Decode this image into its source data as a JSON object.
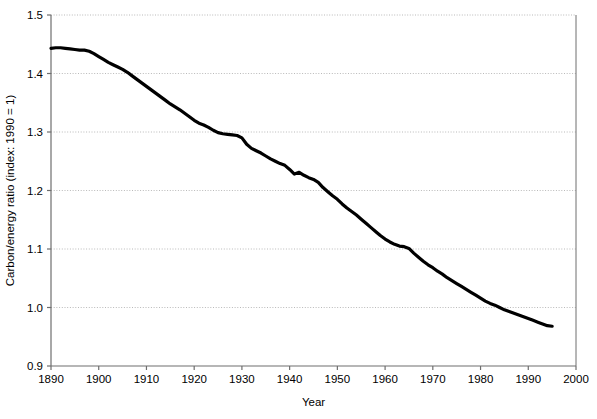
{
  "chart_data": {
    "type": "line",
    "title": "",
    "subtitle": "",
    "xlabel": "Year",
    "ylabel": "Carbon/energy ratio (index: 1990 = 1)",
    "xlim": [
      1890,
      2000
    ],
    "ylim": [
      0.9,
      1.5
    ],
    "xticks": [
      1890,
      1900,
      1910,
      1920,
      1930,
      1940,
      1950,
      1960,
      1970,
      1980,
      1990,
      2000
    ],
    "yticks": [
      0.9,
      1.0,
      1.1,
      1.2,
      1.3,
      1.4,
      1.5
    ],
    "xtick_labels": [
      "1890",
      "1900",
      "1910",
      "1920",
      "1930",
      "1940",
      "1950",
      "1960",
      "1970",
      "1980",
      "1990",
      "2000"
    ],
    "ytick_labels": [
      "0.9",
      "1.0",
      "1.1",
      "1.2",
      "1.3",
      "1.4",
      "1.5"
    ],
    "grid": "horizontal-dotted",
    "legend": "none",
    "line_color": "#000000",
    "line_width": 3.2,
    "axis_color": "#6e6e6e",
    "grid_color": "#b9b9b9",
    "series": [
      {
        "name": "Carbon/energy ratio",
        "x": [
          1890,
          1891,
          1892,
          1893,
          1894,
          1895,
          1896,
          1897,
          1898,
          1899,
          1900,
          1901,
          1902,
          1903,
          1904,
          1905,
          1906,
          1907,
          1908,
          1909,
          1910,
          1911,
          1912,
          1913,
          1914,
          1915,
          1916,
          1917,
          1918,
          1919,
          1920,
          1921,
          1922,
          1923,
          1924,
          1925,
          1926,
          1927,
          1928,
          1929,
          1930,
          1931,
          1932,
          1933,
          1934,
          1935,
          1936,
          1937,
          1938,
          1939,
          1940,
          1941,
          1942,
          1943,
          1944,
          1945,
          1946,
          1947,
          1948,
          1949,
          1950,
          1951,
          1952,
          1953,
          1954,
          1955,
          1956,
          1957,
          1958,
          1959,
          1960,
          1961,
          1962,
          1963,
          1964,
          1965,
          1966,
          1967,
          1968,
          1969,
          1970,
          1971,
          1972,
          1973,
          1974,
          1975,
          1976,
          1977,
          1978,
          1979,
          1980,
          1981,
          1982,
          1983,
          1984,
          1985,
          1986,
          1987,
          1988,
          1989,
          1990,
          1991,
          1992,
          1993,
          1994,
          1995
        ],
        "values": [
          1.443,
          1.444,
          1.444,
          1.443,
          1.442,
          1.441,
          1.44,
          1.44,
          1.438,
          1.434,
          1.429,
          1.424,
          1.419,
          1.415,
          1.411,
          1.407,
          1.402,
          1.396,
          1.39,
          1.384,
          1.378,
          1.372,
          1.366,
          1.36,
          1.354,
          1.348,
          1.343,
          1.338,
          1.332,
          1.326,
          1.32,
          1.315,
          1.312,
          1.308,
          1.303,
          1.299,
          1.297,
          1.296,
          1.295,
          1.294,
          1.29,
          1.279,
          1.272,
          1.268,
          1.264,
          1.259,
          1.254,
          1.25,
          1.246,
          1.243,
          1.236,
          1.228,
          1.231,
          1.226,
          1.222,
          1.219,
          1.214,
          1.205,
          1.198,
          1.191,
          1.185,
          1.177,
          1.17,
          1.164,
          1.158,
          1.151,
          1.144,
          1.137,
          1.13,
          1.123,
          1.117,
          1.112,
          1.108,
          1.105,
          1.104,
          1.101,
          1.093,
          1.086,
          1.079,
          1.073,
          1.068,
          1.062,
          1.057,
          1.051,
          1.046,
          1.041,
          1.036,
          1.031,
          1.026,
          1.021,
          1.016,
          1.011,
          1.007,
          1.004,
          1.0,
          0.996,
          0.993,
          0.99,
          0.987,
          0.984,
          0.981,
          0.978,
          0.975,
          0.972,
          0.969,
          0.968
        ]
      }
    ]
  }
}
